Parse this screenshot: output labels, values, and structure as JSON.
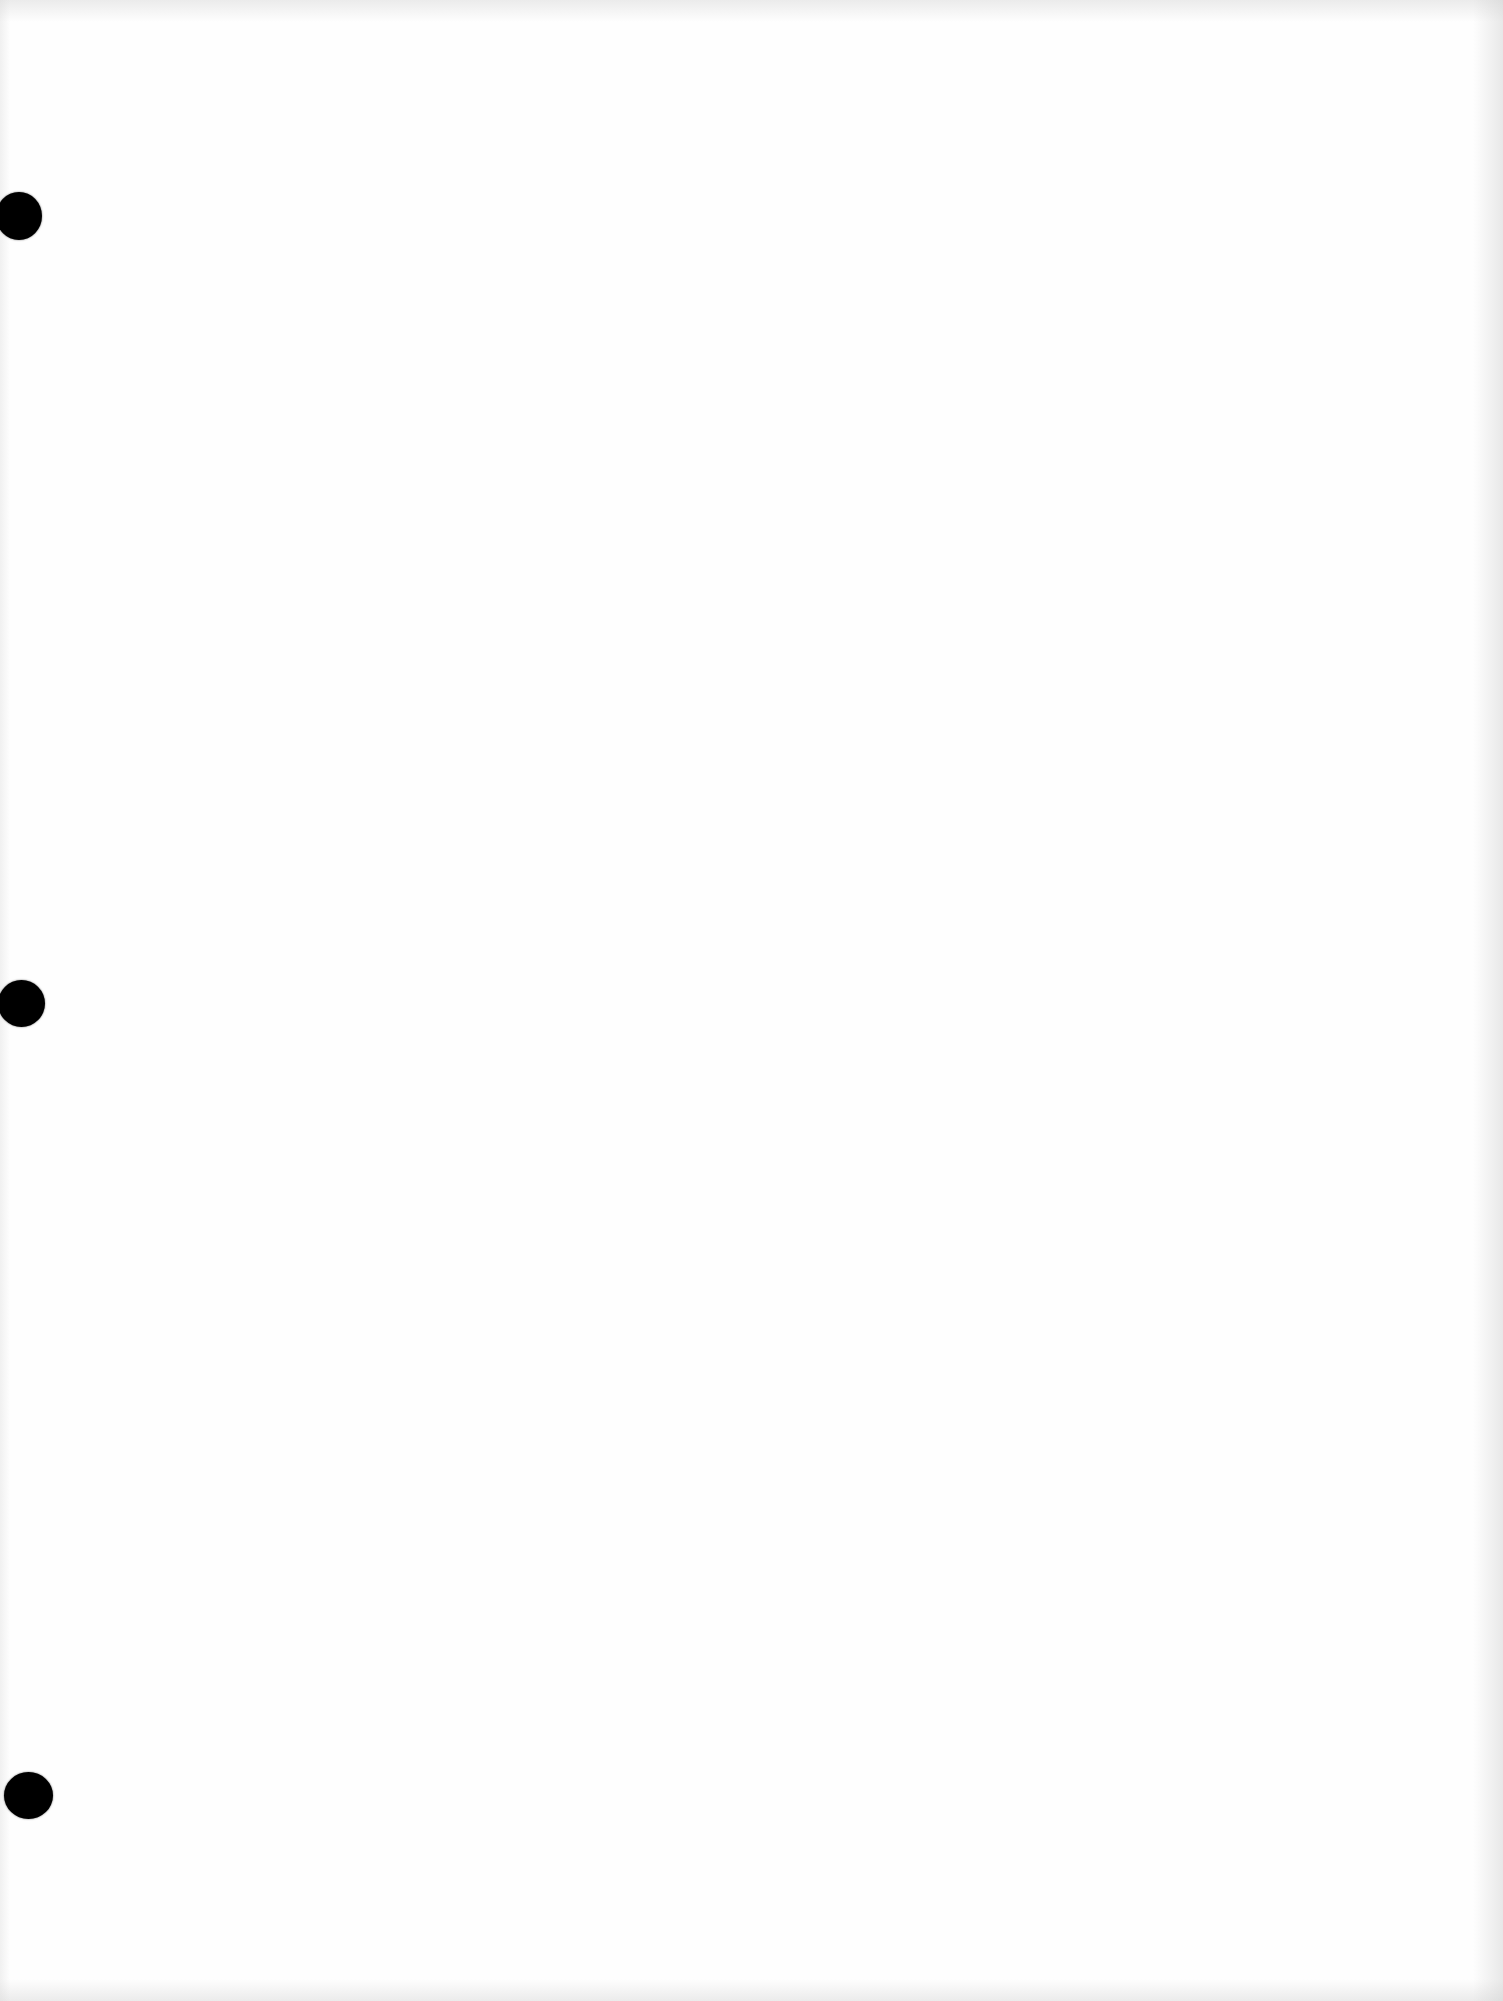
{
  "document": {
    "type": "blank-scanned-page",
    "background_color": "#fefefe",
    "text_content": "",
    "punch_holes": [
      {
        "position": "left-top",
        "color": "#000000"
      },
      {
        "position": "left-middle",
        "color": "#000000"
      },
      {
        "position": "left-bottom",
        "color": "#000000"
      }
    ]
  }
}
